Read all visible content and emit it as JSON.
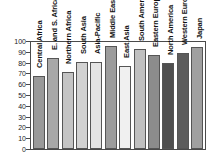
{
  "chart_data": {
    "type": "bar",
    "title": "",
    "xlabel": "",
    "ylabel": "",
    "ylim": [
      0,
      100
    ],
    "yticks": [
      0,
      10,
      20,
      30,
      40,
      50,
      60,
      70,
      80,
      90,
      100
    ],
    "grid": false,
    "legend": "none",
    "label_position": "inside-plot-rotated-vertical",
    "categories": [
      "Central Africa",
      "E. and S. Africa",
      "Northern Africa",
      "South Asia",
      "Asia-Pacific",
      "Middle East",
      "East Asia",
      "South America",
      "Eastern Europe",
      "North America",
      "Western Europe",
      "Japan"
    ],
    "values": [
      68,
      84,
      71,
      81,
      81,
      95,
      77,
      93,
      87,
      80,
      89,
      94
    ],
    "bar_colors": [
      "#9a9a9a",
      "#a8a8a8",
      "#c4c4c4",
      "#d2d2d2",
      "#e4e4e4",
      "#9c9c9c",
      "#f0f0f0",
      "#c0c0c0",
      "#8c8c8c",
      "#4f4f4f",
      "#5c5c5c",
      "#a0a0a0"
    ]
  },
  "axis": {
    "frame_color": "#4a4a4a",
    "tick_color": "#4a4a4a",
    "text_color": "#1a1a1a"
  }
}
